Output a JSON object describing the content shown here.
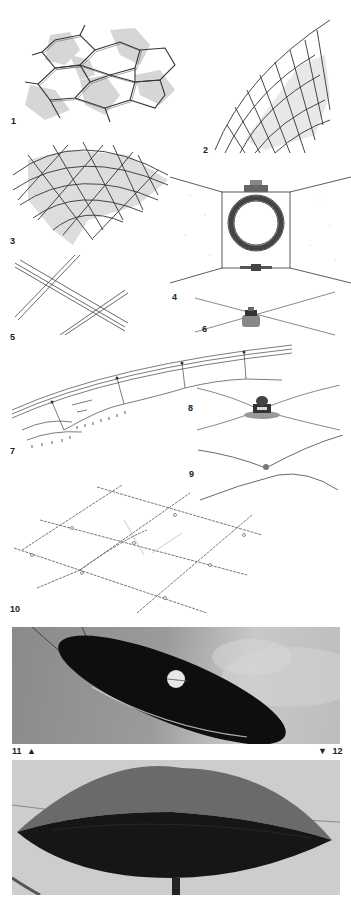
{
  "page": {
    "type": "illustration-plate",
    "background": "#ffffff"
  },
  "figures": [
    {
      "id": "1",
      "label": "1",
      "description": "hexagonal lattice panels with grey shading"
    },
    {
      "id": "2",
      "label": "2",
      "description": "curved grid shell surface"
    },
    {
      "id": "3",
      "label": "3",
      "description": "triangulated dome lattice with grey shading"
    },
    {
      "id": "4",
      "label": "4",
      "description": "cross-section of ring clamp between cable surfaces"
    },
    {
      "id": "5",
      "label": "5",
      "description": "crossing double cables"
    },
    {
      "id": "6",
      "label": "6",
      "description": "cable node clamp"
    },
    {
      "id": "7",
      "label": "7",
      "description": "cable net edge with hangers"
    },
    {
      "id": "8",
      "label": "8",
      "description": "saddle node clamp detail"
    },
    {
      "id": "9",
      "label": "9",
      "description": "cable curve with node"
    },
    {
      "id": "10",
      "label": "10",
      "description": "orthogonal cable net in perspective"
    },
    {
      "id": "11",
      "label": "11",
      "marker": "▲",
      "description": "photograph of dark lenticular membrane tilted"
    },
    {
      "id": "12",
      "label": "12",
      "marker": "▼",
      "description": "photograph of lenticular pneumatic cushion"
    }
  ],
  "colors": {
    "ink": "#333333",
    "shade": "#c8c8c8",
    "photo_dark": "#111111",
    "photo_sky": "#9a9a9a",
    "photo_light_sky": "#cfcfcf"
  }
}
